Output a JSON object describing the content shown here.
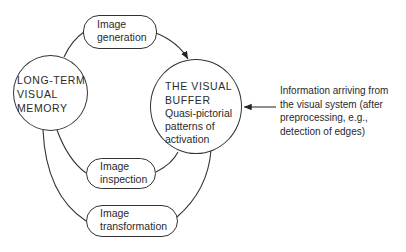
{
  "diagram": {
    "nodes": {
      "ltm": {
        "lines": [
          "LONG-TERM",
          "VISUAL",
          "MEMORY"
        ]
      },
      "buffer": {
        "title_lines": [
          "THE VISUAL",
          "BUFFER"
        ],
        "desc_lines": [
          "Quasi-pictorial",
          "patterns of",
          "activation"
        ]
      },
      "generation": {
        "lines": [
          "Image",
          "generation"
        ]
      },
      "inspection": {
        "lines": [
          "Image",
          "inspection"
        ]
      },
      "transformation": {
        "lines": [
          "Image",
          "transformation"
        ]
      }
    },
    "input_note": {
      "lines": [
        "Information arriving from",
        "the visual system (after",
        "preprocessing, e.g.,",
        "detection of edges)"
      ]
    }
  }
}
